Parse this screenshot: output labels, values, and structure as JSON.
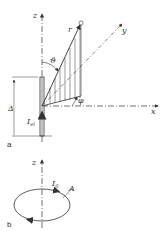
{
  "figure_a": {
    "panel_label": "a",
    "axis_z": "z",
    "axis_x": "x",
    "axis_y": "y",
    "radius_label": "r",
    "theta_label": "ϑ",
    "phi_label": "φ",
    "length_label": "Δ",
    "current_label": "I",
    "current_sub": "el"
  },
  "figure_b": {
    "panel_label": "b",
    "axis_z": "z",
    "current_label": "I",
    "current_sub": "0",
    "area_label": "A"
  },
  "colors": {
    "line": "#333333",
    "background": "#ffffff"
  }
}
